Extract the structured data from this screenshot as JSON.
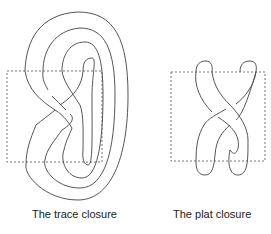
{
  "figures": [
    {
      "id": "trace",
      "caption": "The trace closure"
    },
    {
      "id": "plat",
      "caption": "The plat closure"
    }
  ],
  "colors": {
    "stroke": "#555555",
    "box": "#777777"
  }
}
